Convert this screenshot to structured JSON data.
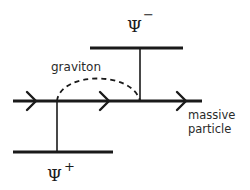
{
  "diagram": {
    "labels": {
      "psi_minus": "Ψ",
      "psi_minus_sup": "−",
      "psi_plus": "Ψ",
      "psi_plus_sup": "+",
      "graviton": "graviton",
      "massive_line1": "massive",
      "massive_line2": "particle"
    },
    "colors": {
      "line": "#1a1a1a",
      "text": "#2a2a2a",
      "background": "#ffffff"
    }
  }
}
